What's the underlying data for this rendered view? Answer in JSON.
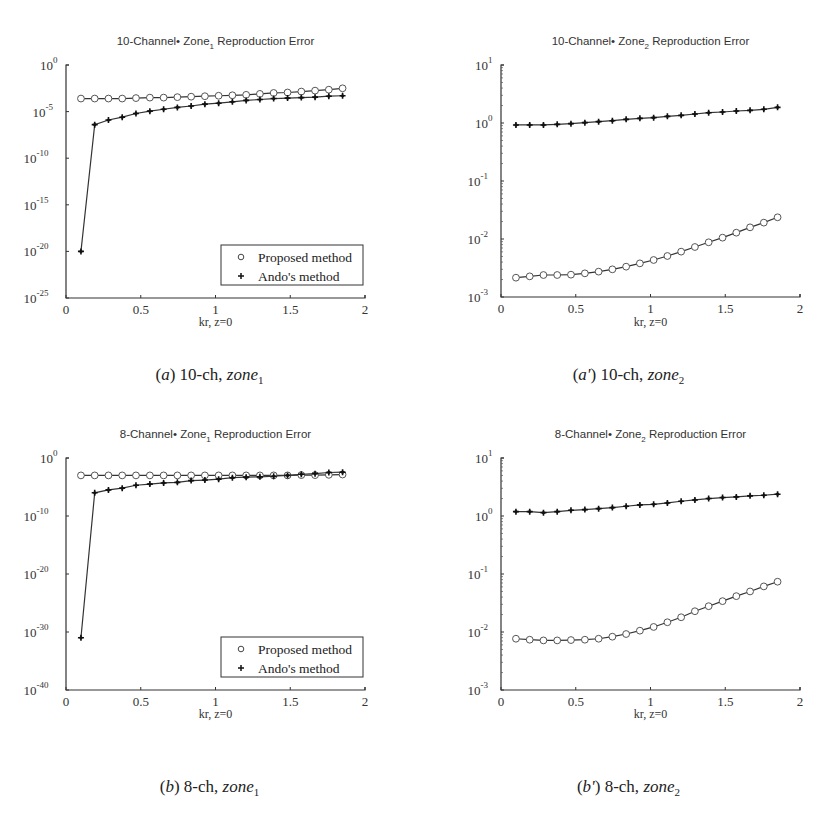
{
  "figure": {
    "panels": [
      {
        "id": "a",
        "caption": {
          "label": "a",
          "prime": "",
          "text": " 10-ch,  ",
          "zone": "zone",
          "sub": "1"
        }
      },
      {
        "id": "a2",
        "caption": {
          "label": "a",
          "prime": "'",
          "text": " 10-ch,  ",
          "zone": "zone",
          "sub": "2"
        }
      },
      {
        "id": "b",
        "caption": {
          "label": "b",
          "prime": "",
          "text": " 8-ch,  ",
          "zone": "zone",
          "sub": "1"
        }
      },
      {
        "id": "b2",
        "caption": {
          "label": "b",
          "prime": "'",
          "text": " 8-ch,  ",
          "zone": "zone",
          "sub": "2"
        }
      }
    ]
  },
  "chart_data": [
    {
      "type": "line",
      "title": "10-Channel•  Zone₁ Reproduction Error",
      "title_parts": {
        "pre": "10-Channel•  Zone",
        "sub": "1",
        "post": " Reproduction Error"
      },
      "xlabel": "kr,  z=0",
      "ylabel": "",
      "yscale": "log",
      "xlim": [
        0,
        2
      ],
      "ylim_exp": [
        -25,
        0
      ],
      "xticks": [
        "0",
        "0.5",
        "1",
        "1.5",
        "2"
      ],
      "yticks_exp": [
        0,
        -5,
        -10,
        -15,
        -20,
        -25
      ],
      "legend": {
        "position": "lower right",
        "entries": [
          "Proposed method",
          "Ando's method"
        ]
      },
      "grid": false,
      "x": [
        0.1,
        0.192,
        0.284,
        0.376,
        0.468,
        0.561,
        0.653,
        0.745,
        0.837,
        0.929,
        1.021,
        1.113,
        1.205,
        1.297,
        1.389,
        1.482,
        1.574,
        1.666,
        1.758,
        1.85
      ],
      "series": [
        {
          "name": "Proposed method",
          "marker": "circle",
          "log10_values": [
            -3.6,
            -3.6,
            -3.6,
            -3.6,
            -3.55,
            -3.5,
            -3.5,
            -3.45,
            -3.4,
            -3.35,
            -3.3,
            -3.25,
            -3.2,
            -3.1,
            -3.0,
            -2.95,
            -2.85,
            -2.75,
            -2.65,
            -2.5
          ]
        },
        {
          "name": "Ando's method",
          "marker": "star",
          "log10_values": [
            -20.0,
            -6.4,
            -5.9,
            -5.6,
            -5.2,
            -4.95,
            -4.75,
            -4.55,
            -4.4,
            -4.2,
            -4.1,
            -3.95,
            -3.8,
            -3.7,
            -3.6,
            -3.55,
            -3.5,
            -3.45,
            -3.35,
            -3.3
          ]
        }
      ]
    },
    {
      "type": "line",
      "title": "10-Channel•  Zone₂ Reproduction Error",
      "title_parts": {
        "pre": "10-Channel•  Zone",
        "sub": "2",
        "post": " Reproduction Error"
      },
      "xlabel": "kr,  z=0",
      "ylabel": "",
      "yscale": "log",
      "xlim": [
        0,
        2
      ],
      "ylim_exp": [
        -3,
        1
      ],
      "xticks": [
        "0",
        "0.5",
        "1",
        "1.5",
        "2"
      ],
      "yticks_exp": [
        1,
        0,
        -1,
        -2,
        -3
      ],
      "legend": null,
      "grid": false,
      "x": [
        0.1,
        0.192,
        0.284,
        0.376,
        0.468,
        0.561,
        0.653,
        0.745,
        0.837,
        0.929,
        1.021,
        1.113,
        1.205,
        1.297,
        1.389,
        1.482,
        1.574,
        1.666,
        1.758,
        1.85
      ],
      "series": [
        {
          "name": "Proposed method",
          "marker": "circle",
          "log10_values": [
            -2.667,
            -2.644,
            -2.621,
            -2.621,
            -2.615,
            -2.592,
            -2.563,
            -2.523,
            -2.477,
            -2.42,
            -2.362,
            -2.293,
            -2.218,
            -2.138,
            -2.057,
            -1.977,
            -1.891,
            -1.799,
            -1.718,
            -1.626
          ]
        },
        {
          "name": "Ando's method",
          "marker": "star",
          "log10_values": [
            -0.034,
            -0.034,
            -0.034,
            -0.023,
            -0.011,
            0.006,
            0.023,
            0.04,
            0.063,
            0.08,
            0.092,
            0.115,
            0.132,
            0.155,
            0.178,
            0.19,
            0.207,
            0.218,
            0.236,
            0.27
          ]
        }
      ]
    },
    {
      "type": "line",
      "title": "8-Channel•  Zone₁ Reproduction Error",
      "title_parts": {
        "pre": "8-Channel•  Zone",
        "sub": "1",
        "post": " Reproduction Error"
      },
      "xlabel": "kr,  z=0",
      "ylabel": "",
      "yscale": "log",
      "xlim": [
        0,
        2
      ],
      "ylim_exp": [
        -40,
        0
      ],
      "xticks": [
        "0",
        "0.5",
        "1",
        "1.5",
        "2"
      ],
      "yticks_exp": [
        0,
        -10,
        -20,
        -30,
        -40
      ],
      "legend": {
        "position": "lower right",
        "entries": [
          "Proposed method",
          "Ando's method"
        ]
      },
      "grid": false,
      "x": [
        0.1,
        0.192,
        0.284,
        0.376,
        0.468,
        0.561,
        0.653,
        0.745,
        0.837,
        0.929,
        1.021,
        1.113,
        1.205,
        1.297,
        1.389,
        1.482,
        1.574,
        1.666,
        1.758,
        1.85
      ],
      "series": [
        {
          "name": "Proposed method",
          "marker": "circle",
          "log10_values": [
            -3.0,
            -3.0,
            -3.0,
            -3.0,
            -3.0,
            -3.0,
            -3.0,
            -3.0,
            -3.0,
            -3.0,
            -3.0,
            -3.0,
            -3.0,
            -3.0,
            -3.0,
            -3.0,
            -2.95,
            -2.95,
            -2.9,
            -2.85
          ]
        },
        {
          "name": "Ando's method",
          "marker": "star",
          "log10_values": [
            -31.0,
            -6.0,
            -5.5,
            -5.2,
            -4.7,
            -4.5,
            -4.3,
            -4.2,
            -3.9,
            -3.8,
            -3.65,
            -3.4,
            -3.3,
            -3.25,
            -3.15,
            -3.0,
            -2.8,
            -2.7,
            -2.5,
            -2.45
          ]
        }
      ]
    },
    {
      "type": "line",
      "title": "8-Channel•  Zone₂ Reproduction Error",
      "title_parts": {
        "pre": "8-Channel•  Zone",
        "sub": "2",
        "post": " Reproduction Error"
      },
      "xlabel": "kr,   z=0",
      "ylabel": "",
      "yscale": "log",
      "xlim": [
        0,
        2
      ],
      "ylim_exp": [
        -3,
        1
      ],
      "xticks": [
        "0",
        "0.5",
        "1",
        "1.5",
        "2"
      ],
      "yticks_exp": [
        1,
        0,
        -1,
        -2,
        -3
      ],
      "legend": null,
      "grid": false,
      "x": [
        0.1,
        0.192,
        0.284,
        0.376,
        0.468,
        0.561,
        0.653,
        0.745,
        0.837,
        0.929,
        1.021,
        1.113,
        1.205,
        1.297,
        1.389,
        1.482,
        1.574,
        1.666,
        1.758,
        1.85
      ],
      "series": [
        {
          "name": "Proposed method",
          "marker": "circle",
          "log10_values": [
            -2.116,
            -2.133,
            -2.145,
            -2.145,
            -2.139,
            -2.133,
            -2.116,
            -2.081,
            -2.035,
            -1.977,
            -1.913,
            -1.832,
            -1.746,
            -1.642,
            -1.555,
            -1.468,
            -1.382,
            -1.301,
            -1.214,
            -1.133
          ]
        },
        {
          "name": "Ando's method",
          "marker": "star",
          "log10_values": [
            0.075,
            0.075,
            0.058,
            0.075,
            0.098,
            0.11,
            0.127,
            0.145,
            0.168,
            0.191,
            0.202,
            0.225,
            0.254,
            0.277,
            0.301,
            0.318,
            0.329,
            0.347,
            0.358,
            0.376
          ]
        }
      ]
    }
  ]
}
